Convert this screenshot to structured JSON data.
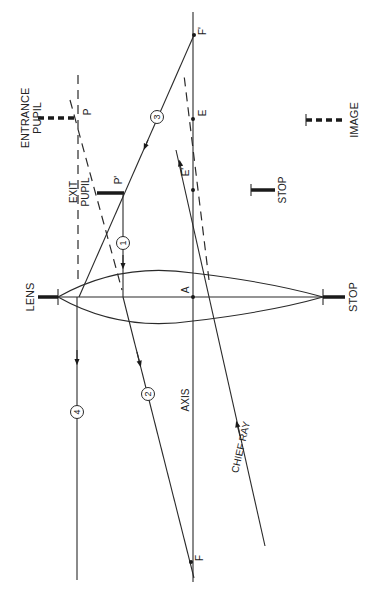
{
  "diagram": {
    "orientation": "rotated 90 degrees clockwise (labels read bottom-to-top)",
    "colors": {
      "ink": "#2a2a2a",
      "background": "#ffffff"
    },
    "labels": {
      "entrance_pupil_1": "ENTRANCE",
      "entrance_pupil_2": "PUPIL",
      "exit_pupil_1": "EXIT",
      "exit_pupil_2": "PUPIL",
      "lens": "LENS",
      "stop_lens": "STOP",
      "stop_small": "STOP",
      "image": "IMAGE",
      "axis": "AXIS",
      "chief_ray": "CHIEF  RAY"
    },
    "points": {
      "P": "P",
      "P_prime": "P'",
      "E": "E",
      "E_prime": "E'",
      "A": "A",
      "F": "F",
      "F_prime": "F'"
    },
    "rays": [
      {
        "id": "ray-1",
        "number": "1"
      },
      {
        "id": "ray-2",
        "number": "2"
      },
      {
        "id": "ray-3",
        "number": "3"
      },
      {
        "id": "ray-4",
        "number": "4"
      }
    ]
  }
}
